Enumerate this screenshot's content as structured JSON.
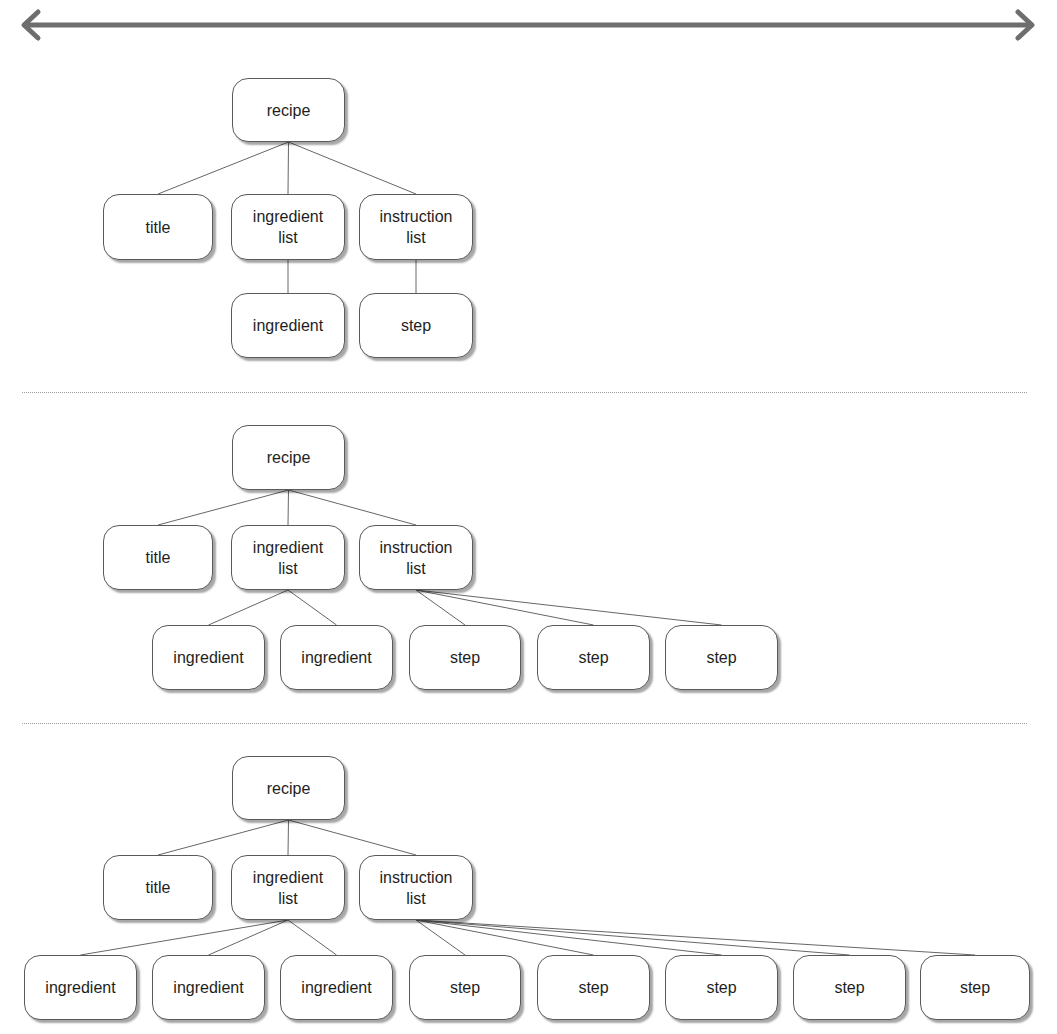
{
  "header": {
    "arrow": {
      "icon": "double-headed-arrow-icon",
      "color": "#6e6e6e",
      "x1": 22,
      "x2": 1034,
      "y": 25
    }
  },
  "colors": {
    "edge": "#666666",
    "node_border": "#5a5a5a",
    "separator": "#9a9a9a"
  },
  "separators": [
    {
      "y": 392
    },
    {
      "y": 723
    }
  ],
  "panels": [
    {
      "name": "panel-1",
      "nodes": [
        {
          "id": "recipe",
          "label": "recipe",
          "x": 232,
          "y": 78,
          "w": 113,
          "h": 64
        },
        {
          "id": "title",
          "label": "title",
          "x": 103,
          "y": 194,
          "w": 110,
          "h": 66
        },
        {
          "id": "ingredient-list",
          "label": "ingredient\nlist",
          "x": 231,
          "y": 194,
          "w": 114,
          "h": 66
        },
        {
          "id": "instruction-list",
          "label": "instruction\nlist",
          "x": 359,
          "y": 194,
          "w": 114,
          "h": 66
        },
        {
          "id": "ingredient-1",
          "label": "ingredient",
          "x": 231,
          "y": 293,
          "w": 114,
          "h": 65
        },
        {
          "id": "step-1",
          "label": "step",
          "x": 359,
          "y": 293,
          "w": 114,
          "h": 65
        }
      ],
      "edges": [
        [
          "recipe",
          "title"
        ],
        [
          "recipe",
          "ingredient-list"
        ],
        [
          "recipe",
          "instruction-list"
        ],
        [
          "ingredient-list",
          "ingredient-1"
        ],
        [
          "instruction-list",
          "step-1"
        ]
      ]
    },
    {
      "name": "panel-2",
      "nodes": [
        {
          "id": "recipe",
          "label": "recipe",
          "x": 232,
          "y": 425,
          "w": 113,
          "h": 65
        },
        {
          "id": "title",
          "label": "title",
          "x": 103,
          "y": 525,
          "w": 110,
          "h": 65
        },
        {
          "id": "ingredient-list",
          "label": "ingredient\nlist",
          "x": 231,
          "y": 525,
          "w": 114,
          "h": 65
        },
        {
          "id": "instruction-list",
          "label": "instruction\nlist",
          "x": 359,
          "y": 525,
          "w": 114,
          "h": 65
        },
        {
          "id": "ingredient-1",
          "label": "ingredient",
          "x": 152,
          "y": 625,
          "w": 113,
          "h": 65
        },
        {
          "id": "ingredient-2",
          "label": "ingredient",
          "x": 280,
          "y": 625,
          "w": 113,
          "h": 65
        },
        {
          "id": "step-1",
          "label": "step",
          "x": 409,
          "y": 625,
          "w": 112,
          "h": 65
        },
        {
          "id": "step-2",
          "label": "step",
          "x": 537,
          "y": 625,
          "w": 113,
          "h": 65
        },
        {
          "id": "step-3",
          "label": "step",
          "x": 665,
          "y": 625,
          "w": 113,
          "h": 65
        }
      ],
      "edges": [
        [
          "recipe",
          "title"
        ],
        [
          "recipe",
          "ingredient-list"
        ],
        [
          "recipe",
          "instruction-list"
        ],
        [
          "ingredient-list",
          "ingredient-1"
        ],
        [
          "ingredient-list",
          "ingredient-2"
        ],
        [
          "instruction-list",
          "step-1"
        ],
        [
          "instruction-list",
          "step-2"
        ],
        [
          "instruction-list",
          "step-3"
        ]
      ]
    },
    {
      "name": "panel-3",
      "nodes": [
        {
          "id": "recipe",
          "label": "recipe",
          "x": 232,
          "y": 756,
          "w": 113,
          "h": 64
        },
        {
          "id": "title",
          "label": "title",
          "x": 103,
          "y": 855,
          "w": 110,
          "h": 65
        },
        {
          "id": "ingredient-list",
          "label": "ingredient\nlist",
          "x": 231,
          "y": 855,
          "w": 114,
          "h": 65
        },
        {
          "id": "instruction-list",
          "label": "instruction\nlist",
          "x": 359,
          "y": 855,
          "w": 114,
          "h": 65
        },
        {
          "id": "ingredient-1",
          "label": "ingredient",
          "x": 24,
          "y": 955,
          "w": 113,
          "h": 65
        },
        {
          "id": "ingredient-2",
          "label": "ingredient",
          "x": 152,
          "y": 955,
          "w": 113,
          "h": 65
        },
        {
          "id": "ingredient-3",
          "label": "ingredient",
          "x": 280,
          "y": 955,
          "w": 113,
          "h": 65
        },
        {
          "id": "step-1",
          "label": "step",
          "x": 409,
          "y": 955,
          "w": 112,
          "h": 65
        },
        {
          "id": "step-2",
          "label": "step",
          "x": 537,
          "y": 955,
          "w": 113,
          "h": 65
        },
        {
          "id": "step-3",
          "label": "step",
          "x": 665,
          "y": 955,
          "w": 113,
          "h": 65
        },
        {
          "id": "step-4",
          "label": "step",
          "x": 793,
          "y": 955,
          "w": 113,
          "h": 65
        },
        {
          "id": "step-5",
          "label": "step",
          "x": 920,
          "y": 955,
          "w": 110,
          "h": 65
        }
      ],
      "edges": [
        [
          "recipe",
          "title"
        ],
        [
          "recipe",
          "ingredient-list"
        ],
        [
          "recipe",
          "instruction-list"
        ],
        [
          "ingredient-list",
          "ingredient-1"
        ],
        [
          "ingredient-list",
          "ingredient-2"
        ],
        [
          "ingredient-list",
          "ingredient-3"
        ],
        [
          "instruction-list",
          "step-1"
        ],
        [
          "instruction-list",
          "step-2"
        ],
        [
          "instruction-list",
          "step-3"
        ],
        [
          "instruction-list",
          "step-4"
        ],
        [
          "instruction-list",
          "step-5"
        ]
      ]
    }
  ]
}
